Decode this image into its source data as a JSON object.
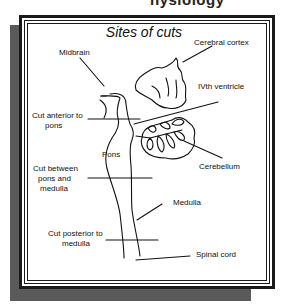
{
  "page": {
    "clipped_heading": "hysiology"
  },
  "diagram": {
    "title": "Sites of cuts",
    "labels": {
      "midbrain": "Midbrain",
      "cerebral_cortex": "Cerebral cortex",
      "ivth_ventricle": "IVth ventricle",
      "cut_anterior_line1": "Cut anterior to",
      "cut_anterior_line2": "pons",
      "pons": "Pons",
      "cerebellum": "Cerebellum",
      "cut_between_line1": "Cut between",
      "cut_between_line2": "pons and",
      "cut_between_line3": "medulla",
      "medulla": "Medulla",
      "cut_posterior_line1": "Cut posterior to",
      "cut_posterior_line2": "medulla",
      "spinal_cord": "Spinal cord"
    }
  }
}
